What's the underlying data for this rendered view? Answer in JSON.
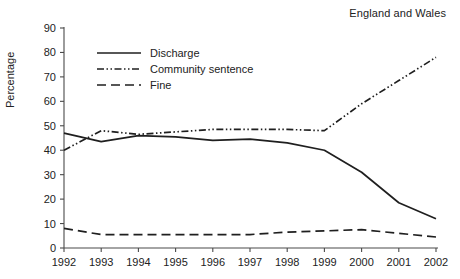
{
  "chart_data": {
    "type": "line",
    "title": "England and Wales",
    "xlabel": "",
    "ylabel": "Percentage",
    "x": [
      1992,
      1993,
      1994,
      1995,
      1996,
      1997,
      1998,
      1999,
      2000,
      2001,
      2002
    ],
    "xtick_labels": [
      "1992",
      "1993",
      "1994",
      "1995",
      "1996",
      "1997",
      "1998",
      "1999",
      "2000",
      "2001",
      "2002"
    ],
    "ytick_labels": [
      "0",
      "10",
      "20",
      "30",
      "40",
      "50",
      "60",
      "70",
      "80",
      "90"
    ],
    "yticks": [
      0,
      10,
      20,
      30,
      40,
      50,
      60,
      70,
      80,
      90
    ],
    "ylim": [
      0,
      90
    ],
    "xlim": [
      1992,
      2002
    ],
    "grid": false,
    "legend_position": "upper left",
    "series": [
      {
        "name": "Discharge",
        "style": "solid",
        "color": "#1f1f1f",
        "values": [
          47,
          43.5,
          46,
          45.5,
          44,
          44.5,
          43,
          40,
          31,
          18.5,
          12
        ]
      },
      {
        "name": "Community sentence",
        "style": "dash-dot-dot",
        "color": "#1f1f1f",
        "values": [
          40,
          48,
          46.5,
          47.5,
          48.5,
          48.5,
          48.5,
          48,
          59,
          68.5,
          78
        ]
      },
      {
        "name": "Fine",
        "style": "dashed",
        "color": "#1f1f1f",
        "values": [
          8,
          5.5,
          5.5,
          5.5,
          5.5,
          5.5,
          6.5,
          7,
          7.5,
          6,
          4.5
        ]
      }
    ]
  },
  "legend": {
    "items": [
      {
        "label": "Discharge"
      },
      {
        "label": "Community sentence"
      },
      {
        "label": "Fine"
      }
    ]
  }
}
